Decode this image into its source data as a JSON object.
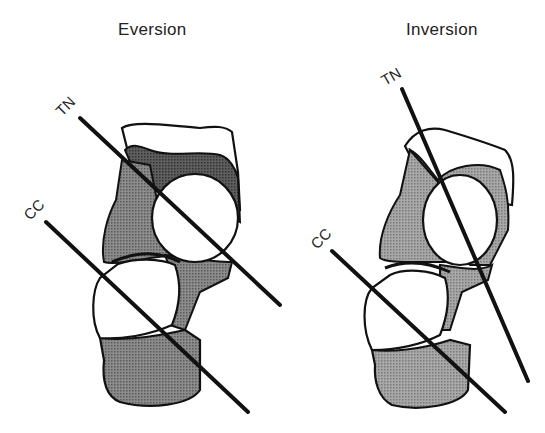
{
  "panels": [
    {
      "title": "Eversion",
      "axes": [
        {
          "label": "TN",
          "name": "talonavicular-axis"
        },
        {
          "label": "CC",
          "name": "calcaneocuboid-axis"
        }
      ]
    },
    {
      "title": "Inversion",
      "axes": [
        {
          "label": "TN",
          "name": "talonavicular-axis"
        },
        {
          "label": "CC",
          "name": "calcaneocuboid-axis"
        }
      ]
    }
  ],
  "colors": {
    "line": "#111111",
    "bone_dark_fill": "#6e6e6e",
    "bone_mid_fill": "#9a9a9a",
    "bone_light_fill": "#ffffff"
  }
}
